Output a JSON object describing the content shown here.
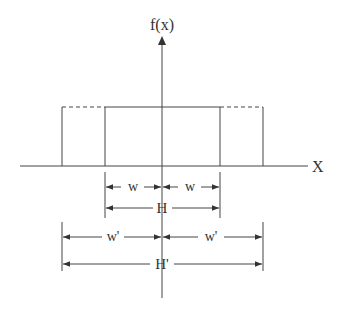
{
  "diagram": {
    "y_axis_label": "f(x)",
    "x_axis_label": "X",
    "dimensions": {
      "w_left": "w",
      "w_right": "w",
      "H": "H",
      "wp_left": "w'",
      "wp_right": "w'",
      "Hp": "H'"
    },
    "colors": {
      "line": "#444444",
      "text": "#333333",
      "background": "#ffffff"
    }
  }
}
